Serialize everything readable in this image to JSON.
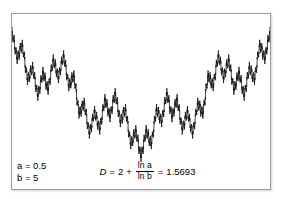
{
  "figure": {
    "name": "weierstrass-function-plot",
    "background_color": "#ffffff",
    "frame_color": "#9a9a9a",
    "curve_color": "#1a1a1a"
  },
  "parameters": {
    "a_label": "a = 0.5",
    "b_label": "b = 5"
  },
  "formula": {
    "lhs": "D",
    "equals_1": "=",
    "constant": "2",
    "plus": "+",
    "numerator": "ln a",
    "denominator": "ln b",
    "equals_2": "=",
    "result": "1.5693"
  },
  "chart_data": {
    "type": "line",
    "title": "",
    "xlabel": "",
    "ylabel": "",
    "xlim": [
      0,
      1
    ],
    "ylim": [
      -1.6,
      1.6
    ],
    "grid": false,
    "legend": null,
    "function": "Weierstrass: W(x) = sum_{n=0}^{N} a^n cos(b^n pi x)",
    "params": {
      "a": 0.5,
      "b": 5,
      "terms": 7
    },
    "fractal_dimension": 1.5693,
    "annotations": [
      {
        "text": "a = 0.5",
        "position": "bottom-left"
      },
      {
        "text": "b = 5",
        "position": "bottom-left"
      },
      {
        "text": "D = 2 + ln a / ln b = 1.5693",
        "position": "bottom-center"
      }
    ],
    "series": [
      {
        "name": "W(x)",
        "color": "#1a1a1a",
        "samples": 2600
      }
    ]
  }
}
